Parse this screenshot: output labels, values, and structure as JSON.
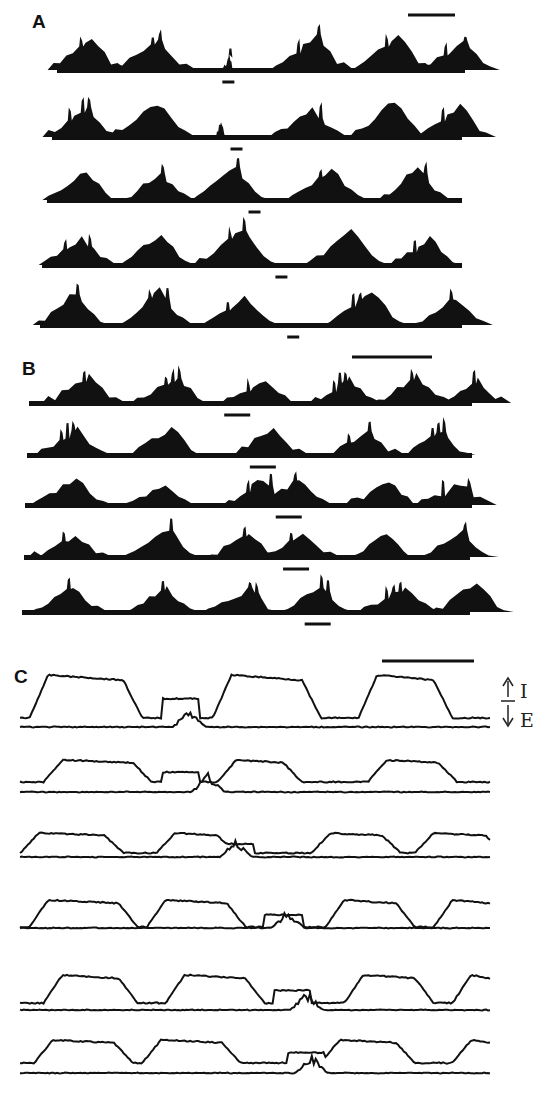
{
  "figure": {
    "panels": [
      {
        "id": "A",
        "label": "A",
        "type": "burst-raster",
        "scale_bar": true,
        "rows": [
          {
            "bursts": [
              0.07,
              0.23,
              0.42,
              0.62,
              0.82,
              0.98
            ],
            "marker": 0.42,
            "small_burst": 2
          },
          {
            "bursts": [
              0.07,
              0.24,
              0.41,
              0.62,
              0.82,
              0.98
            ],
            "marker": 0.45,
            "small_burst": 2
          },
          {
            "bursts": [
              0.08,
              0.26,
              0.44,
              0.67,
              0.88
            ],
            "marker": 0.5,
            "small_burst": -1
          },
          {
            "bursts": [
              0.08,
              0.27,
              0.46,
              0.72,
              0.91
            ],
            "marker": 0.57,
            "small_burst": -1
          },
          {
            "bursts": [
              0.07,
              0.27,
              0.47,
              0.77,
              0.97
            ],
            "marker": 0.6,
            "small_burst": -1
          }
        ]
      },
      {
        "id": "B",
        "label": "B",
        "type": "burst-raster",
        "scale_bar": true,
        "rows": [
          {
            "bursts": [
              0.12,
              0.32,
              0.52,
              0.71,
              0.86,
              1.0
            ],
            "marker": 0.47
          },
          {
            "bursts": [
              0.1,
              0.31,
              0.54,
              0.75,
              0.92
            ],
            "marker": 0.53
          },
          {
            "bursts": [
              0.1,
              0.3,
              0.52,
              0.6,
              0.8,
              0.96
            ],
            "marker": 0.59
          },
          {
            "bursts": [
              0.1,
              0.31,
              0.49,
              0.61,
              0.8,
              0.97
            ],
            "marker": 0.61
          },
          {
            "bursts": [
              0.1,
              0.31,
              0.49,
              0.65,
              0.84,
              1.0
            ],
            "marker": 0.66
          }
        ]
      },
      {
        "id": "C",
        "label": "C",
        "type": "trace-pairs",
        "scale_bar": true,
        "legend": {
          "up_label": "I",
          "down_label": "E",
          "up_arrow": "↑",
          "down_arrow": "↓"
        },
        "rows": [
          {
            "plateaus": [
              [
                0.06,
                0.22
              ],
              [
                0.45,
                0.6
              ],
              [
                0.76,
                0.88
              ]
            ],
            "extra": 0.33,
            "spike": 0.36
          },
          {
            "plateaus": [
              [
                0.09,
                0.24
              ],
              [
                0.46,
                0.56
              ],
              [
                0.78,
                0.89
              ]
            ],
            "extra": 0.33,
            "spike": 0.4
          },
          {
            "plateaus": [
              [
                0.04,
                0.18
              ],
              [
                0.33,
                0.42
              ],
              [
                0.66,
                0.77
              ],
              [
                0.88,
                0.99
              ]
            ],
            "extra": 0.45,
            "spike": 0.46
          },
          {
            "plateaus": [
              [
                0.06,
                0.21
              ],
              [
                0.31,
                0.44
              ],
              [
                0.69,
                0.8
              ],
              [
                0.92,
                1.0
              ]
            ],
            "extra": 0.55,
            "spike": 0.57
          },
          {
            "plateaus": [
              [
                0.09,
                0.21
              ],
              [
                0.35,
                0.48
              ],
              [
                0.73,
                0.84
              ],
              [
                0.96,
                1.0
              ]
            ],
            "extra": 0.57,
            "spike": 0.61
          },
          {
            "plateaus": [
              [
                0.07,
                0.2
              ],
              [
                0.3,
                0.43
              ],
              [
                0.68,
                0.8
              ],
              [
                0.96,
                1.0
              ]
            ],
            "extra": 0.6,
            "spike": 0.62
          }
        ]
      }
    ]
  }
}
